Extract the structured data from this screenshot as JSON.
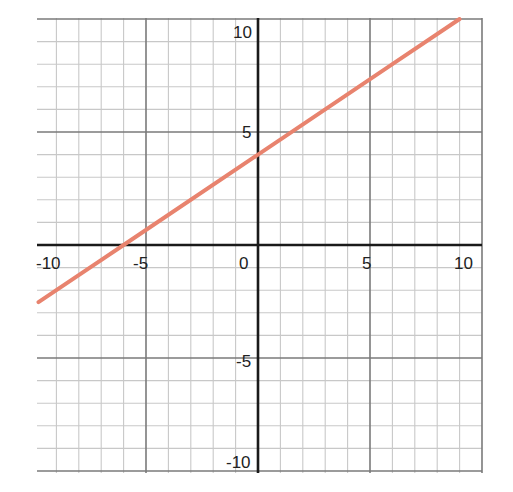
{
  "chart_data": {
    "type": "line",
    "title": "",
    "xlabel": "",
    "ylabel": "",
    "xlim": [
      -10,
      10
    ],
    "ylim": [
      -10,
      10
    ],
    "grid": true,
    "grid_step": 1,
    "major_step": 5,
    "x_tick_labels": [
      "-10",
      "-5",
      "0",
      "5",
      "10"
    ],
    "y_tick_labels": [
      "10",
      "5",
      "-5",
      "-10"
    ],
    "series": [
      {
        "name": "y = (2/3)x + 4",
        "equation": {
          "slope": 0.6667,
          "intercept": 4
        },
        "x_intercept": -6,
        "y_intercept": 4,
        "points": [
          [
            -9.8,
            -2.53
          ],
          [
            -6,
            0
          ],
          [
            0,
            4
          ],
          [
            3,
            6
          ],
          [
            6,
            8
          ],
          [
            9,
            10
          ]
        ],
        "color": "#e8836e"
      }
    ]
  },
  "colors": {
    "axis": "#1a1a1a",
    "minor_grid": "#c8c8c8",
    "major_grid": "#7a7a7a",
    "line": "#e8836e",
    "background": "#ffffff"
  }
}
